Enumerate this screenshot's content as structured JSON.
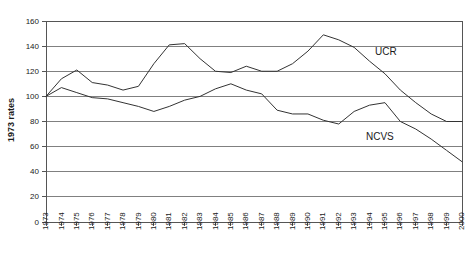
{
  "chart_data": {
    "type": "line",
    "title": "",
    "xlabel": "",
    "ylabel": "1973 rates",
    "ylim": [
      0,
      160
    ],
    "ytick_step": 20,
    "yticks": [
      0,
      20,
      40,
      60,
      80,
      100,
      120,
      140,
      160
    ],
    "grid": "horizontal",
    "legend": "inline-labels",
    "categories": [
      "1973",
      "1974",
      "1975",
      "1976",
      "1977",
      "1978",
      "1979",
      "1980",
      "1981",
      "1982",
      "1983",
      "1984",
      "1985",
      "1986",
      "1987",
      "1988",
      "1989",
      "1990",
      "1991",
      "1992",
      "1993",
      "1994",
      "1995",
      "1996",
      "1997",
      "1998",
      "1999",
      "2000"
    ],
    "series": [
      {
        "name": "UCR",
        "label": "UCR",
        "color": "#333333",
        "values": [
          100,
          114,
          121,
          111,
          109,
          105,
          108,
          126,
          141,
          142,
          130,
          120,
          119,
          124,
          120,
          120,
          126,
          136,
          149,
          145,
          139,
          128,
          118,
          105,
          95,
          86,
          80,
          80
        ]
      },
      {
        "name": "NCVS",
        "label": "NCVS",
        "color": "#333333",
        "values": [
          100,
          107,
          103,
          99,
          98,
          95,
          92,
          88,
          92,
          97,
          100,
          106,
          110,
          105,
          102,
          89,
          86,
          86,
          81,
          78,
          88,
          93,
          95,
          80,
          74,
          66,
          57,
          48
        ]
      }
    ],
    "annotations": [
      {
        "text": "UCR",
        "series": "UCR",
        "x": "1994",
        "y": 126
      },
      {
        "text": "NCVS",
        "series": "NCVS",
        "x": "1995",
        "y": 72
      }
    ]
  },
  "layout": {
    "plot": {
      "left": 46,
      "top": 21,
      "right": 462,
      "bottom": 222
    },
    "ucr_label_pos": {
      "x": 375,
      "y": 52
    },
    "ncvs_label_pos": {
      "x": 366,
      "y": 137
    },
    "ylabel_pos": {
      "x": 14,
      "y": 120
    }
  }
}
